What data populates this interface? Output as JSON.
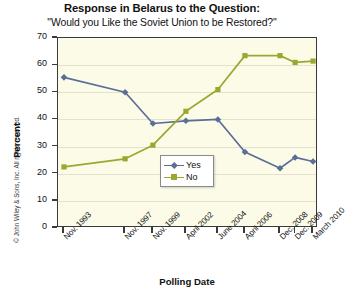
{
  "title": {
    "main": "Response in Belarus to the Question:",
    "sub": "\"Would you Like the Soviet Union to be Restored?\""
  },
  "credit": "© John Wiley & Sons, Inc. All rights reserved.",
  "axes": {
    "xlabel": "Polling Date",
    "ylabel": "Percent"
  },
  "legend": {
    "position": "inside-center",
    "items": [
      {
        "label": "Yes",
        "color": "#5b6e96",
        "marker": "diamond"
      },
      {
        "label": "No",
        "color": "#9aa830",
        "marker": "square"
      }
    ]
  },
  "chart_data": {
    "type": "line",
    "title": "Response in Belarus to the Question: \"Would you Like the Soviet Union to be Restored?\"",
    "xlabel": "Polling Date",
    "ylabel": "Percent",
    "ylim": [
      0,
      70
    ],
    "yticks": [
      0,
      10,
      20,
      30,
      40,
      50,
      60,
      70
    ],
    "grid": true,
    "categories": [
      "Nov. 1993",
      "Nov. 1997",
      "Nov. 1999",
      "April 2002",
      "June 2004",
      "April 2006",
      "Dec. 2008",
      "Dec. 2009",
      "March 2010"
    ],
    "x_positions": [
      2.3,
      25.8,
      36.5,
      49.2,
      61.5,
      71.9,
      85.4,
      91.2,
      98.1
    ],
    "series": [
      {
        "name": "Yes",
        "color": "#5b6e96",
        "marker": "diamond",
        "values": [
          55.5,
          50.0,
          38.5,
          39.5,
          40.0,
          28.0,
          22.0,
          26.0,
          24.5
        ]
      },
      {
        "name": "No",
        "color": "#9aa830",
        "marker": "square",
        "values": [
          22.5,
          25.5,
          30.5,
          43.0,
          51.0,
          63.5,
          63.5,
          61.0,
          61.5
        ]
      }
    ]
  }
}
